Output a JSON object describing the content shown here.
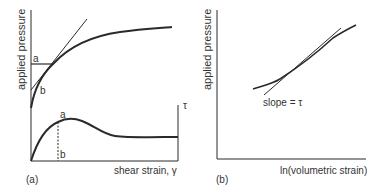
{
  "panel_a": {
    "tag": "(a)",
    "y_label": "applied pressure",
    "x_label": "shear strain, γ",
    "right_axis_label": "τ",
    "upper_point_a": "a",
    "upper_point_b": "b",
    "lower_point_a": "a",
    "lower_point_b": "b"
  },
  "panel_b": {
    "tag": "(b)",
    "y_label": "applied pressure",
    "x_label": "ln(volumetric strain)",
    "annotation": "slope = τ"
  },
  "colors": {
    "line": "#2a2a2a",
    "text": "#333333"
  }
}
